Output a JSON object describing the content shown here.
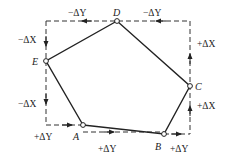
{
  "diagram": {
    "type": "traverse-polygon",
    "points": [
      {
        "id": "A",
        "label": "A",
        "x": 83,
        "y": 125
      },
      {
        "id": "B",
        "label": "B",
        "x": 164,
        "y": 134
      },
      {
        "id": "C",
        "label": "C",
        "x": 190,
        "y": 86
      },
      {
        "id": "D",
        "label": "D",
        "x": 117,
        "y": 21
      },
      {
        "id": "E",
        "label": "E",
        "x": 46,
        "y": 61
      }
    ],
    "increments": {
      "ED_top_left": "−ΔY",
      "DC_top_right": "−ΔY",
      "CD_right_upper": "+ΔX",
      "BC_right_lower": "+ΔX",
      "E_left_upper": "−ΔX",
      "AE_left_lower": "−ΔX",
      "EA_bottom_left": "+ΔY",
      "AB_bottom": "+ΔY",
      "B_bottom_right": "+ΔY"
    }
  }
}
